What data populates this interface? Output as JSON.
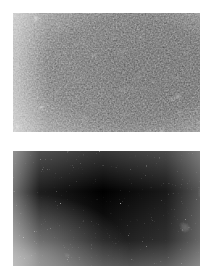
{
  "figure": {
    "background_color": "#ffffff",
    "canvas_width": 213,
    "canvas_height": 275,
    "panel_count": 2,
    "caption": "",
    "title": ""
  },
  "panels": [
    {
      "id": "panel-coarse",
      "name": "upper-micrograph",
      "position_label": "top",
      "x": 13,
      "y": 13,
      "width": 187,
      "height": 119,
      "texture_type": "cellular-foam",
      "description": "Coarse granular cellular microstructure; light polygonal grains separated by thin dark boundary walls",
      "grain_scale_px": 8,
      "ink_color": "#1c1c1c",
      "background_color": "#ffffff",
      "mean_tone": "#d8d8d8",
      "density": "medium",
      "label": ""
    },
    {
      "id": "panel-fine",
      "name": "lower-micrograph",
      "position_label": "bottom",
      "x": 13,
      "y": 151,
      "width": 187,
      "height": 115,
      "texture_type": "fine-speckle",
      "description": "Fine-grained mottled speckle noise; high frequency dark specks on white, darker through the vertical centre band",
      "grain_scale_px": 2,
      "ink_color": "#181818",
      "background_color": "#ffffff",
      "mean_tone": "#b4b4b4",
      "density": "high",
      "label": ""
    }
  ]
}
